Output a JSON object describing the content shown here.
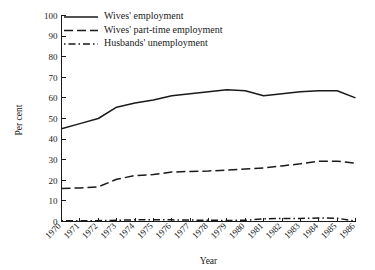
{
  "chart_data": {
    "type": "line",
    "title": "",
    "xlabel": "Year",
    "ylabel": "Per cent",
    "ylim": [
      0,
      100
    ],
    "yticks": [
      0,
      10,
      20,
      30,
      40,
      50,
      60,
      70,
      80,
      90,
      100
    ],
    "grid": false,
    "legend_position": "top-left",
    "categories": [
      "1970",
      "1971",
      "1972",
      "1973",
      "1974",
      "1975",
      "1976",
      "1977",
      "1978",
      "1979",
      "1980",
      "1981",
      "1982",
      "1983",
      "1984",
      "1985",
      "1986"
    ],
    "x": [
      1970,
      1971,
      1972,
      1973,
      1974,
      1975,
      1976,
      1977,
      1978,
      1979,
      1980,
      1981,
      1982,
      1983,
      1984,
      1985,
      1986
    ],
    "series": [
      {
        "name": "Wives' employment",
        "style": "solid",
        "values": [
          45.0,
          47.5,
          50.0,
          55.5,
          57.5,
          59.0,
          61.0,
          62.0,
          63.0,
          64.0,
          63.5,
          61.0,
          62.0,
          63.0,
          63.5,
          63.5,
          60.0
        ]
      },
      {
        "name": "Wives' part-time employment",
        "style": "dashed",
        "values": [
          16.0,
          16.3,
          16.8,
          20.5,
          22.3,
          22.8,
          24.0,
          24.3,
          24.5,
          25.0,
          25.5,
          26.0,
          27.0,
          28.0,
          29.3,
          29.3,
          28.3
        ]
      },
      {
        "name": "Husbands' unemployment",
        "style": "dash-dot",
        "values": [
          0.3,
          0.4,
          0.4,
          0.6,
          0.8,
          0.8,
          0.8,
          0.7,
          0.6,
          0.5,
          0.6,
          1.3,
          1.5,
          1.5,
          1.7,
          1.6,
          0.2
        ]
      }
    ]
  },
  "colors": {
    "ink": "#1a1a1a",
    "background": "#ffffff"
  }
}
